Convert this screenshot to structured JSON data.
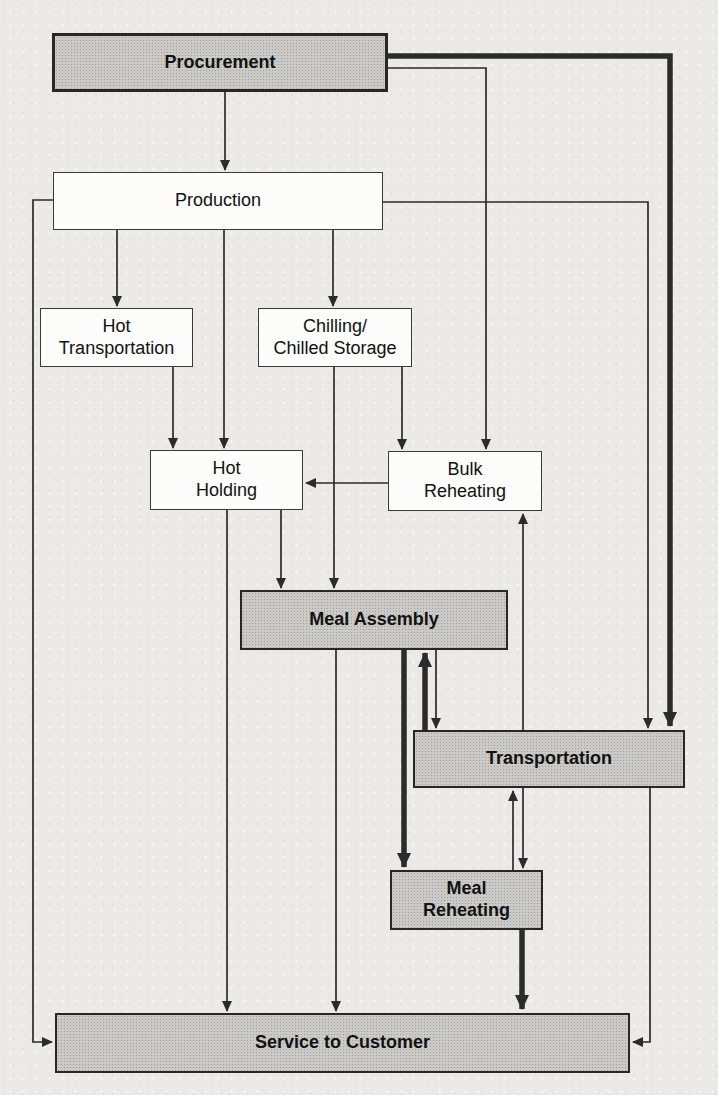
{
  "diagram": {
    "type": "flowchart",
    "colors": {
      "background": "#ebeae7",
      "shaded_box_fill": "#cbcac7",
      "plain_box_fill": "#fcfcfa",
      "box_border": "#2b2b2b",
      "line": "#2b2b2b"
    },
    "nodes": [
      {
        "id": "procurement",
        "label": "Procurement",
        "shaded": true,
        "x": 52,
        "y": 33,
        "w": 336,
        "h": 59
      },
      {
        "id": "production",
        "label": "Production",
        "shaded": false,
        "x": 53,
        "y": 172,
        "w": 330,
        "h": 58
      },
      {
        "id": "hot-transportation",
        "label": "Hot\nTransportation",
        "shaded": false,
        "x": 40,
        "y": 308,
        "w": 153,
        "h": 59
      },
      {
        "id": "chilling",
        "label": "Chilling/\nChilled Storage",
        "shaded": false,
        "x": 258,
        "y": 308,
        "w": 154,
        "h": 59
      },
      {
        "id": "hot-holding",
        "label": "Hot\nHolding",
        "shaded": false,
        "x": 150,
        "y": 450,
        "w": 153,
        "h": 60
      },
      {
        "id": "bulk-reheating",
        "label": "Bulk\nReheating",
        "shaded": false,
        "x": 388,
        "y": 451,
        "w": 154,
        "h": 60
      },
      {
        "id": "meal-assembly",
        "label": "Meal Assembly",
        "shaded": true,
        "x": 240,
        "y": 590,
        "w": 268,
        "h": 60
      },
      {
        "id": "transportation",
        "label": "Transportation",
        "shaded": true,
        "x": 413,
        "y": 730,
        "w": 272,
        "h": 58
      },
      {
        "id": "meal-reheating",
        "label": "Meal\nReheating",
        "shaded": true,
        "x": 390,
        "y": 870,
        "w": 153,
        "h": 60
      },
      {
        "id": "service",
        "label": "Service to Customer",
        "shaded": true,
        "x": 55,
        "y": 1013,
        "w": 575,
        "h": 60
      }
    ],
    "edges": [
      {
        "from": "procurement",
        "to": "production",
        "thick": false,
        "points": [
          [
            225,
            92
          ],
          [
            225,
            170
          ]
        ]
      },
      {
        "from": "production",
        "to": "hot-transportation",
        "thick": false,
        "points": [
          [
            117,
            230
          ],
          [
            117,
            306
          ]
        ]
      },
      {
        "from": "production",
        "to": "hot-holding",
        "thick": false,
        "points": [
          [
            224,
            230
          ],
          [
            224,
            448
          ]
        ]
      },
      {
        "from": "production",
        "to": "chilling",
        "thick": false,
        "points": [
          [
            333,
            230
          ],
          [
            333,
            306
          ]
        ]
      },
      {
        "from": "hot-transportation",
        "to": "hot-holding",
        "thick": false,
        "points": [
          [
            173,
            367
          ],
          [
            173,
            448
          ]
        ]
      },
      {
        "from": "chilling",
        "to": "meal-assembly",
        "thick": false,
        "points": [
          [
            334,
            367
          ],
          [
            334,
            588
          ]
        ]
      },
      {
        "from": "chilling",
        "to": "bulk-reheating",
        "thick": false,
        "points": [
          [
            402,
            367
          ],
          [
            402,
            449
          ]
        ]
      },
      {
        "from": "procurement",
        "to": "bulk-reheating",
        "thick": false,
        "points": [
          [
            388,
            68
          ],
          [
            486,
            68
          ],
          [
            486,
            449
          ]
        ]
      },
      {
        "from": "bulk-reheating",
        "to": "hot-holding",
        "thick": false,
        "points": [
          [
            388,
            483
          ],
          [
            306,
            483
          ]
        ]
      },
      {
        "from": "hot-holding",
        "to": "service",
        "thick": false,
        "points": [
          [
            227,
            510
          ],
          [
            227,
            1011
          ]
        ]
      },
      {
        "from": "hot-holding",
        "to": "meal-assembly",
        "thick": false,
        "points": [
          [
            281,
            510
          ],
          [
            281,
            588
          ]
        ]
      },
      {
        "from": "meal-assembly",
        "to": "service",
        "thick": false,
        "points": [
          [
            336,
            650
          ],
          [
            336,
            1011
          ]
        ]
      },
      {
        "from": "meal-assembly",
        "to": "meal-reheating",
        "thick": true,
        "points": [
          [
            404,
            650
          ],
          [
            404,
            867
          ]
        ]
      },
      {
        "from": "transportation",
        "to": "meal-assembly",
        "thick": true,
        "points": [
          [
            425,
            730
          ],
          [
            425,
            653
          ]
        ]
      },
      {
        "from": "meal-assembly",
        "to": "transportation",
        "thick": false,
        "points": [
          [
            436,
            650
          ],
          [
            436,
            728
          ]
        ]
      },
      {
        "from": "production",
        "to": "transportation",
        "thick": false,
        "points": [
          [
            383,
            202
          ],
          [
            648,
            202
          ],
          [
            648,
            728
          ]
        ]
      },
      {
        "from": "procurement",
        "to": "transportation",
        "thick": true,
        "points": [
          [
            388,
            56
          ],
          [
            670,
            56
          ],
          [
            670,
            726
          ]
        ]
      },
      {
        "from": "transportation",
        "to": "bulk-reheating",
        "thick": false,
        "points": [
          [
            523,
            730
          ],
          [
            523,
            514
          ]
        ]
      },
      {
        "from": "meal-reheating",
        "to": "transportation",
        "thick": false,
        "points": [
          [
            513,
            870
          ],
          [
            513,
            791
          ]
        ]
      },
      {
        "from": "transportation",
        "to": "meal-reheating",
        "thick": false,
        "points": [
          [
            523,
            788
          ],
          [
            523,
            868
          ]
        ]
      },
      {
        "from": "meal-reheating",
        "to": "service",
        "thick": true,
        "points": [
          [
            522,
            930
          ],
          [
            522,
            1009
          ]
        ]
      },
      {
        "from": "transportation",
        "to": "service",
        "thick": false,
        "points": [
          [
            650,
            788
          ],
          [
            650,
            1042
          ],
          [
            633,
            1042
          ]
        ]
      },
      {
        "from": "production",
        "to": "service",
        "thick": false,
        "points": [
          [
            53,
            200
          ],
          [
            33,
            200
          ],
          [
            33,
            1042
          ],
          [
            52,
            1042
          ]
        ]
      }
    ]
  }
}
